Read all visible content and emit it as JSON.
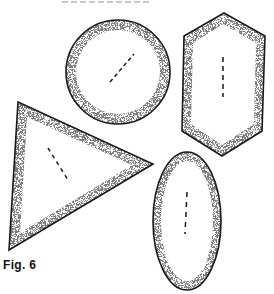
{
  "figure": {
    "caption": "Fig. 6",
    "stroke_color": "#1a1a1a",
    "stipple_color": "#555555",
    "background": "#ffffff",
    "shapes": [
      {
        "name": "circle",
        "type": "circle",
        "cx": 118,
        "cy": 72,
        "r": 52,
        "axis": {
          "x1": 110,
          "y1": 82,
          "x2": 134,
          "y2": 54
        }
      },
      {
        "name": "hexagon",
        "type": "polygon",
        "points": "224,13 265,36 262,131 222,156 182,131 184,36",
        "axis": {
          "x1": 223,
          "y1": 57,
          "x2": 223,
          "y2": 97
        }
      },
      {
        "name": "triangle",
        "type": "polygon",
        "points": "18,102 153,164 9,250",
        "axis": {
          "x1": 48,
          "y1": 148,
          "x2": 68,
          "y2": 180
        }
      },
      {
        "name": "ellipse",
        "type": "ellipse",
        "cx": 187,
        "cy": 221,
        "rx": 34,
        "ry": 69,
        "axis": {
          "x1": 187,
          "y1": 192,
          "x2": 185,
          "y2": 234
        }
      }
    ]
  }
}
